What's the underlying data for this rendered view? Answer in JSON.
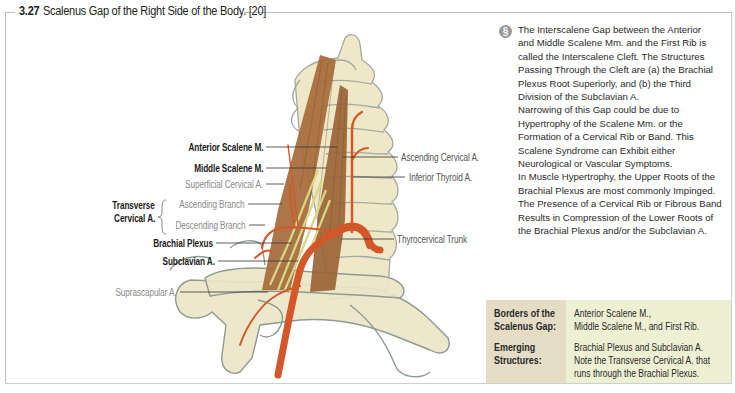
{
  "figure": {
    "number": "3.27",
    "title": "Scalenus Gap of the Right Side of the Body. [20]"
  },
  "labels": {
    "anterior_scalene": "Anterior Scalene M.",
    "middle_scalene": "Middle Scalene M.",
    "superficial_cervical": "Superficial Cervical A.",
    "transverse_cervical_line1": "Transverse",
    "transverse_cervical_line2": "Cervical A.",
    "ascending_branch": "Ascending Branch",
    "descending_branch": "Descending Branch",
    "brachial_plexus": "Brachial Plexus",
    "subclavian": "Subclavian A.",
    "suprascapular": "Suprascapular A.",
    "ascending_cervical": "Ascending Cervical A.",
    "inferior_thyroid": "Inferior Thyroid A.",
    "thyrocervical_trunk": "Thyrocervical Trunk"
  },
  "info": {
    "icon": "info-circle-icon",
    "lines": [
      "The Interscalene Gap between the Anterior",
      "and Middle Scalene Mm. and the First Rib is",
      "called the Interscalene Cleft. The Structures",
      "Passing Through the Cleft are (a) the Brachial",
      "Plexus Root Superiorly, and (b) the Third",
      "Division of the Subclavian A.",
      "Narrowing of this Gap could be due to",
      "Hypertrophy of the Scalene Mm. or the",
      "Formation of a Cervical Rib or Band. This",
      "Scalene Syndrome can Exhibit either",
      "Neurological or Vascular Symptoms.",
      "In Muscle Hypertrophy, the Upper Roots of the",
      "Brachial Plexus are most commonly Impinged.",
      "The Presence of a Cervical Rib or Fibrous Band",
      "Results in Compression of the Lower Roots of",
      "the Brachial Plexus and/or the Subclavian A."
    ]
  },
  "table": {
    "rows": [
      {
        "header": [
          "Borders of the",
          "Scalenus Gap:"
        ],
        "value": [
          "Anterior Scalene M.,",
          "Middle Scalene M., and  First Rib."
        ]
      },
      {
        "header": [
          "Emerging",
          "Structures:"
        ],
        "value": [
          "Brachial Plexus and Subclavian A.",
          "Note the Transverse Cervical A. that",
          "runs through the Brachial Plexus."
        ]
      }
    ]
  },
  "colors": {
    "bone": "#efe8c8",
    "bone_outline": "#9aa49a",
    "muscle": "#a86a3a",
    "artery": "#d4572a",
    "nerve": "#d8d88a",
    "table_header_bg": "#e4dcc4",
    "table_value_bg": "#eef0d4"
  }
}
